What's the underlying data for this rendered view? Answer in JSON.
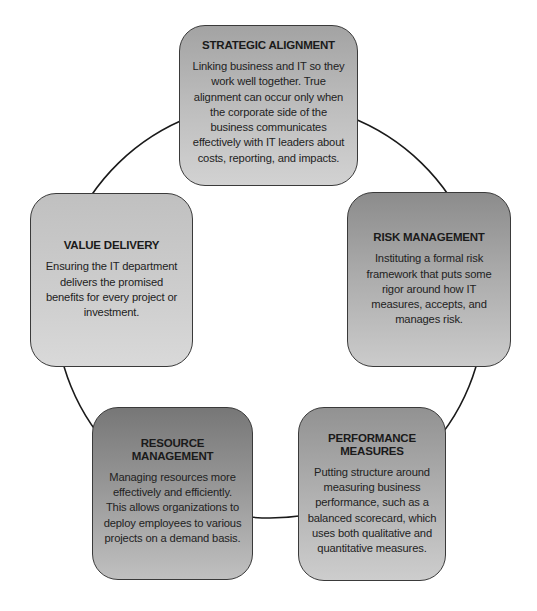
{
  "diagram": {
    "type": "cycle",
    "nodes": [
      {
        "id": "strategic",
        "title": "STRATEGIC ALIGNMENT",
        "description": "Linking business and IT so they work well together. True alignment can occur only when the corporate side of the business communicates effectively with IT leaders about costs, reporting, and impacts."
      },
      {
        "id": "risk",
        "title": "RISK MANAGEMENT",
        "description": "Instituting a formal risk framework that puts some rigor around how IT measures, accepts, and manages risk."
      },
      {
        "id": "performance",
        "title": "PERFORMANCE MEASURES",
        "description": "Putting structure around measuring business performance, such as a balanced scorecard, which uses both qualitative and quantitative measures."
      },
      {
        "id": "resource",
        "title": "RESOURCE MANAGEMENT",
        "description": "Managing resources more effectively and efficiently. This allows organizations to deploy employees to various projects on a demand basis."
      },
      {
        "id": "value",
        "title": "VALUE DELIVERY",
        "description": "Ensuring the IT department delivers the promised benefits for every project or investment."
      }
    ],
    "connector_color": "#1a1a1a"
  }
}
